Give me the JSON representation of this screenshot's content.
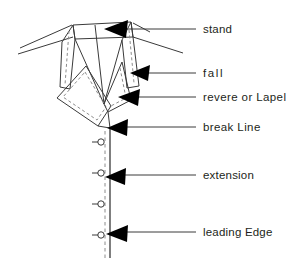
{
  "diagram": {
    "ink_color": "#231f20",
    "line_color": "#3a3a3a",
    "dashed_color": "#8c8c8c",
    "background": "#ffffff",
    "labels": [
      {
        "id": "stand",
        "text": "stand",
        "x": 203,
        "y": 33,
        "points_to": "collar stand (upper neck band)"
      },
      {
        "id": "fall",
        "text": "fall",
        "x": 203,
        "y": 77,
        "points_to": "collar fall (turned-down portion)"
      },
      {
        "id": "revere-lapel",
        "text": "revere or Lapel",
        "x": 203,
        "y": 101,
        "points_to": "revere / lapel panel"
      },
      {
        "id": "break-line",
        "text": "break Line",
        "x": 203,
        "y": 131,
        "points_to": "break line / roll line"
      },
      {
        "id": "extension",
        "text": "extension",
        "x": 203,
        "y": 179,
        "points_to": "front extension beyond centre front"
      },
      {
        "id": "leading-edge",
        "text": "leading Edge",
        "x": 203,
        "y": 236,
        "points_to": "leading edge of front"
      }
    ],
    "leaders": [
      {
        "id": "leader-stand",
        "x1": 196,
        "y1": 29,
        "x2": 124,
        "y2": 29
      },
      {
        "id": "leader-fall",
        "x1": 196,
        "y1": 73,
        "x2": 146,
        "y2": 73
      },
      {
        "id": "leader-revere",
        "x1": 196,
        "y1": 97,
        "x2": 136,
        "y2": 97
      },
      {
        "id": "leader-break-line",
        "x1": 196,
        "y1": 127,
        "x2": 117,
        "y2": 127
      },
      {
        "id": "leader-extension",
        "x1": 196,
        "y1": 175,
        "x2": 112,
        "y2": 175
      },
      {
        "id": "leader-leading-edge",
        "x1": 196,
        "y1": 232,
        "x2": 116,
        "y2": 232
      }
    ],
    "arrowheads": [
      {
        "id": "arrow-stand",
        "tip_x": 104,
        "tip_y": 29
      },
      {
        "id": "arrow-fall",
        "tip_x": 130,
        "tip_y": 73
      },
      {
        "id": "arrow-revere",
        "tip_x": 118,
        "tip_y": 97
      },
      {
        "id": "arrow-break-line",
        "tip_x": 107,
        "tip_y": 128
      },
      {
        "id": "arrow-extension",
        "tip_x": 105,
        "tip_y": 177
      },
      {
        "id": "arrow-leading-edge",
        "tip_x": 106,
        "tip_y": 234
      }
    ],
    "buttons": [
      {
        "id": "button-1",
        "cx": 101,
        "cy": 142,
        "r": 3.2,
        "tick_x1": 92,
        "tick_x2": 98
      },
      {
        "id": "button-2",
        "cx": 101,
        "cy": 173,
        "r": 3.2,
        "tick_x1": 92,
        "tick_x2": 98
      },
      {
        "id": "button-3",
        "cx": 101,
        "cy": 204,
        "r": 3.2,
        "tick_x1": 92,
        "tick_x2": 98
      },
      {
        "id": "button-4",
        "cx": 101,
        "cy": 235,
        "r": 3.2,
        "tick_x1": 92,
        "tick_x2": 98
      }
    ],
    "front_edges": {
      "leading_edge_line": {
        "x": 110,
        "y1": 128,
        "y2": 258,
        "style": "solid"
      },
      "centre_front_line": {
        "x": 105,
        "y1": 130,
        "y2": 258,
        "style": "dashed"
      }
    },
    "collar_outline": {
      "style_solid": "solid outline of collar and lapel panels",
      "style_dashed": "dashed stitching / roll lines inside panels"
    }
  }
}
